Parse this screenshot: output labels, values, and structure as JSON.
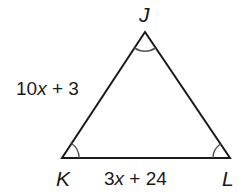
{
  "diagram": {
    "type": "triangle",
    "vertices": [
      {
        "id": "J",
        "label": "J",
        "x": 145,
        "y": 32
      },
      {
        "id": "K",
        "label": "K",
        "x": 62,
        "y": 158
      },
      {
        "id": "L",
        "label": "L",
        "x": 230,
        "y": 158
      }
    ],
    "sides": {
      "JK": {
        "label_pre": "10",
        "label_var": "x",
        "label_post": " + 3"
      },
      "KL": {
        "label_pre": "3",
        "label_var": "x",
        "label_post": " + 24"
      }
    },
    "angle_marks": [
      "J",
      "K",
      "L"
    ],
    "colors": {
      "stroke": "#1a1a1a",
      "arc": "#555555"
    }
  }
}
